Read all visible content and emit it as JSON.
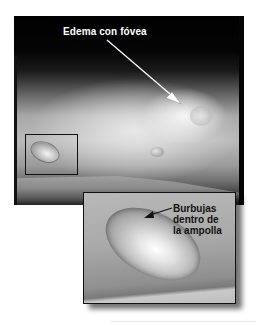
{
  "figure": {
    "main_photo": {
      "label": "Edema con fóvea",
      "label_color": "#ffffff",
      "background_color": "#000000"
    },
    "inset_photo": {
      "label_lines": [
        "Burbujas",
        "dentro de",
        "la ampolla"
      ],
      "label_color": "#111111"
    }
  }
}
